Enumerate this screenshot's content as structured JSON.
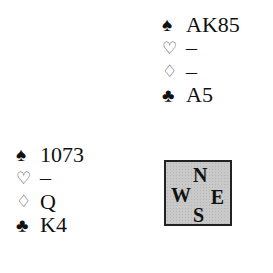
{
  "north": {
    "spades": "AK85",
    "hearts": "–",
    "diamonds": "–",
    "clubs": "A5"
  },
  "west": {
    "spades": "1073",
    "hearts": "–",
    "diamonds": "Q",
    "clubs": "K4"
  },
  "suits": {
    "spade": "♠",
    "heart": "♡",
    "diamond": "♢",
    "club": "♣"
  },
  "compass": {
    "n": "N",
    "w": "W",
    "e": "E",
    "s": "S"
  }
}
